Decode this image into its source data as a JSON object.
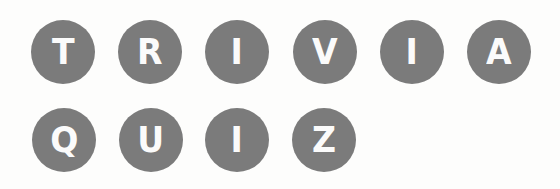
{
  "title": {
    "words": [
      "TRIVIA",
      "QUIZ"
    ],
    "row1": {
      "letters": [
        "T",
        "R",
        "I",
        "V",
        "I",
        "A"
      ]
    },
    "row2": {
      "letters": [
        "Q",
        "U",
        "I",
        "Z"
      ]
    }
  },
  "colors": {
    "circle": "#7b7b7b",
    "letter": "#fbfbfb",
    "background": "#fdfdfc"
  }
}
